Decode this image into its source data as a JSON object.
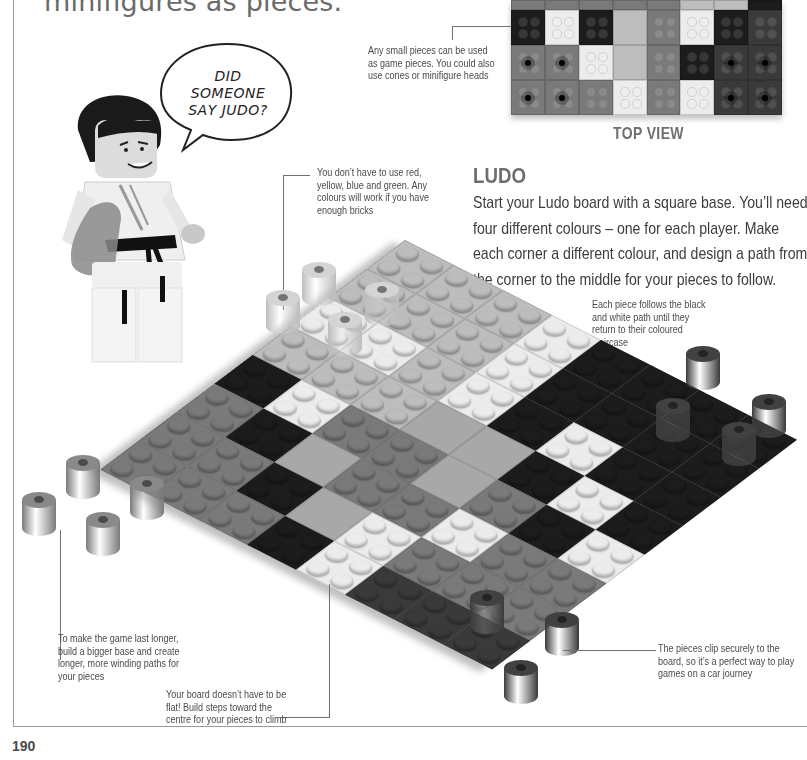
{
  "page": {
    "intro_tail": "minifigures as pieces.",
    "page_number": "190"
  },
  "speech_bubble": {
    "lines": [
      "DID",
      "SOMEONE",
      "SAY JUDO?"
    ]
  },
  "top_view": {
    "label": "TOP VIEW",
    "grid": [
      [
        "mid",
        "mid",
        "mid",
        "mid",
        "mid",
        "light",
        "light",
        "black"
      ],
      [
        "black",
        "white",
        "black",
        "light",
        "mid",
        "white",
        "black",
        "dark"
      ],
      [
        "mid-hole",
        "mid-hole",
        "white",
        "light",
        "mid",
        "black",
        "dark-hole",
        "dark-hole"
      ],
      [
        "mid-hole",
        "mid-hole",
        "mid",
        "white",
        "mid",
        "white",
        "dark-hole",
        "dark-hole"
      ]
    ]
  },
  "section": {
    "title": "LUDO",
    "body": "Start your Ludo board with a square base. You’ll need four different colours – one for each player. Make each corner a different colour, and design a path from the corner to the middle for your pieces to follow."
  },
  "callouts": {
    "small_pieces": "Any small pieces can be used as game pieces. You could also use cones or minifigure heads",
    "colours": "You don’t have to use red, yellow, blue and green. Any colours will work if you have enough bricks",
    "path": "Each piece follows the black and white path until they return to their coloured staircase",
    "longer_game": "To make the game last longer, build a bigger base and create longer, more winding paths for your pieces",
    "steps": "Your board doesn’t have to be flat! Build steps toward the centre for your pieces to climb",
    "clip": "The pieces clip securely to the board, so it’s a perfect way to play games on a car journey"
  },
  "colors": {
    "light": "#bdbdbd",
    "white": "#ececec",
    "black": "#1c1c1c",
    "mid": "#7a7a7a",
    "dark": "#3a3a3a",
    "flat": "#a8a8a8",
    "text": "#3c3c3c",
    "heading": "#6e6e6e"
  },
  "board": {
    "rows": [
      [
        "light",
        "light",
        "light",
        "white",
        "black",
        "black",
        "black",
        "black"
      ],
      [
        "light",
        "light",
        "light",
        "white",
        "black",
        "black",
        "black",
        "black"
      ],
      [
        "white",
        "white",
        "light",
        "white",
        "black",
        "white",
        "black",
        "black"
      ],
      [
        "light",
        "light",
        "light",
        "flat",
        "flat",
        "black",
        "white",
        "black"
      ],
      [
        "black",
        "white",
        "mid",
        "mid",
        "flat",
        "mid",
        "black",
        "white"
      ],
      [
        "mid",
        "black",
        "flat",
        "mid",
        "mid",
        "white",
        "mid",
        "mid"
      ],
      [
        "mid",
        "mid",
        "black",
        "flat",
        "white",
        "mid",
        "mid",
        "mid"
      ],
      [
        "mid",
        "mid",
        "mid",
        "black",
        "white",
        "dark",
        "dark",
        "dark"
      ]
    ]
  }
}
